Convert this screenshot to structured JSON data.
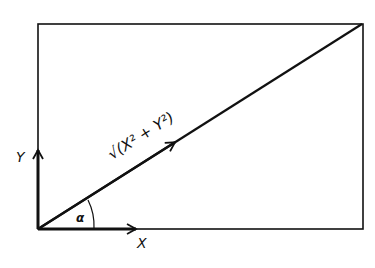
{
  "diagram": {
    "title": "",
    "labels": {
      "x_axis": "X",
      "y_axis": "Y",
      "hypotenuse": "√(X² + Y²)",
      "angle": "α"
    },
    "colors": {
      "stroke": "#111111",
      "background": "#ffffff"
    },
    "shapes": {
      "rectangle": {
        "x": 38,
        "y": 24,
        "width": 325,
        "height": 205
      },
      "diagonal": {
        "from": [
          38,
          229
        ],
        "to": [
          362,
          24
        ]
      },
      "x_vector": {
        "from": [
          38,
          229
        ],
        "to": [
          136,
          229
        ]
      },
      "y_vector": {
        "from": [
          38,
          229
        ],
        "to": [
          38,
          150
        ]
      }
    }
  }
}
